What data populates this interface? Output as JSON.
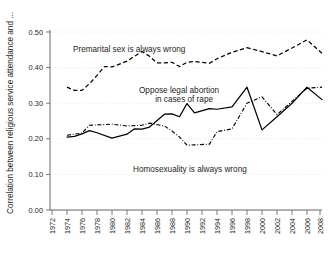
{
  "chart_data": {
    "type": "line",
    "title": "",
    "xlabel": "",
    "ylabel": "Correlation between religious service attendance and ...",
    "xlim": [
      1972,
      2008
    ],
    "ylim": [
      0.0,
      0.5
    ],
    "grid": true,
    "legend_position": "inline-annotations",
    "ytick_labels": [
      "0.00",
      "0.10",
      "0.20",
      "0.30",
      "0.40",
      "0.50"
    ],
    "ytick_values": [
      0.0,
      0.1,
      0.2,
      0.3,
      0.4,
      0.5
    ],
    "xtick_labels": [
      "1972",
      "1974",
      "1976",
      "1978",
      "1980",
      "1982",
      "1984",
      "1986",
      "1988",
      "1990",
      "1992",
      "1994",
      "1996",
      "1998",
      "2000",
      "2002",
      "2004",
      "2006",
      "2008"
    ],
    "xtick_values": [
      1972,
      1974,
      1976,
      1978,
      1980,
      1982,
      1984,
      1986,
      1988,
      1990,
      1992,
      1994,
      1996,
      1998,
      2000,
      2002,
      2004,
      2006,
      2008
    ],
    "series": [
      {
        "name": "Premarital sex is always wrong",
        "style": "dashed",
        "color": "#000000",
        "x": [
          1974,
          1975,
          1976,
          1977,
          1978,
          1979,
          1980,
          1982,
          1983,
          1984,
          1985,
          1986,
          1987,
          1988,
          1989,
          1990,
          1991,
          1993,
          1994,
          1996,
          1998,
          2000,
          2002,
          2004,
          2006,
          2008
        ],
        "values": [
          0.345,
          0.336,
          0.336,
          0.355,
          0.378,
          0.403,
          0.402,
          0.418,
          0.432,
          0.445,
          0.432,
          0.413,
          0.413,
          0.415,
          0.403,
          0.415,
          0.417,
          0.412,
          0.425,
          0.443,
          0.456,
          0.445,
          0.433,
          0.455,
          0.478,
          0.44
        ]
      },
      {
        "name": "Oppose legal abortion in cases of rape",
        "style": "solid",
        "color": "#000000",
        "x": [
          1974,
          1975,
          1976,
          1977,
          1978,
          1980,
          1982,
          1983,
          1984,
          1985,
          1987,
          1988,
          1989,
          1990,
          1991,
          1993,
          1994,
          1996,
          1998,
          2000,
          2002,
          2004,
          2006,
          2008
        ],
        "values": [
          0.205,
          0.207,
          0.214,
          0.223,
          0.217,
          0.202,
          0.213,
          0.228,
          0.227,
          0.233,
          0.269,
          0.27,
          0.262,
          0.299,
          0.273,
          0.285,
          0.283,
          0.29,
          0.345,
          0.225,
          0.262,
          0.3,
          0.345,
          0.31
        ]
      },
      {
        "name": "Homosexuality is always wrong",
        "style": "dash-dot",
        "color": "#000000",
        "x": [
          1974,
          1976,
          1977,
          1980,
          1982,
          1984,
          1985,
          1987,
          1988,
          1989,
          1990,
          1991,
          1993,
          1994,
          1996,
          1998,
          2000,
          2002,
          2004,
          2006,
          2008
        ],
        "values": [
          0.21,
          0.216,
          0.238,
          0.241,
          0.236,
          0.238,
          0.244,
          0.236,
          0.222,
          0.205,
          0.182,
          0.183,
          0.185,
          0.22,
          0.228,
          0.3,
          0.318,
          0.268,
          0.305,
          0.342,
          0.345
        ]
      }
    ],
    "annotations": [
      {
        "text": "Premarital sex is always wrong",
        "x_px": 73,
        "y_px": 52
      },
      {
        "text": "Oppose legal abortion",
        "x_px": 139,
        "y_px": 93
      },
      {
        "text": "in cases of rape",
        "x_px": 160,
        "y_px": 102
      },
      {
        "text": "Homosexuality is always wrong",
        "x_px": 133,
        "y_px": 172
      }
    ]
  }
}
